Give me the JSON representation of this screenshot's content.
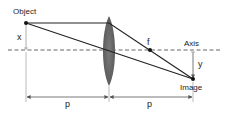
{
  "diagram": {
    "type": "thin-lens ray diagram",
    "labels": {
      "object": "Object",
      "image": "Image",
      "axis": "Axis",
      "focal": "f",
      "object_height": "x",
      "image_height": "y",
      "object_distance": "p",
      "image_distance": "p"
    },
    "colors": {
      "line": "#222222",
      "axis_dash": "#666666",
      "lens": "#6b6b6b",
      "guide": "#999999"
    }
  }
}
